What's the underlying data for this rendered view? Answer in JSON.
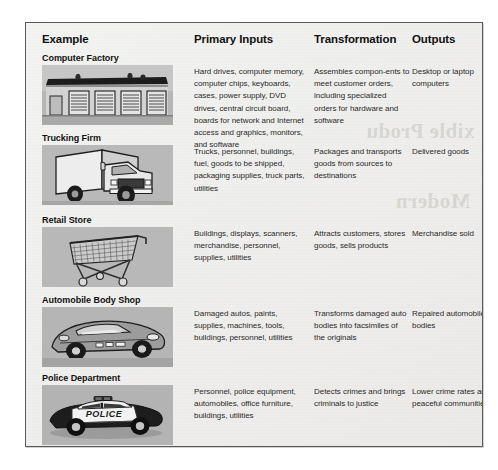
{
  "page": {
    "bleed_through_line1": "xible Produ",
    "bleed_through_line2": "Modern"
  },
  "table": {
    "columns": [
      {
        "key": "example",
        "label": "Example"
      },
      {
        "key": "inputs",
        "label": "Primary Inputs"
      },
      {
        "key": "transform",
        "label": "Transformation"
      },
      {
        "key": "outputs",
        "label": "Outputs"
      }
    ],
    "rows": [
      {
        "name": "Computer Factory",
        "image": "computer-factory-illustration",
        "inputs": "Hard drives, computer memory, computer chips, keyboards, cases, power supply, DVD drives, central circuit board, boards for network and Internet access and graphics, monitors, and software",
        "transform": "Assembles compon-ents to meet customer orders, including specialized orders for hardware and software",
        "outputs": "Desktop or laptop computers"
      },
      {
        "name": "Trucking Firm",
        "image": "delivery-truck-illustration",
        "inputs": "Trucks, personnel, buildings, fuel, goods to be shipped, packaging supplies, truck parts, utilities",
        "transform": "Packages and transports goods from sources to destinations",
        "outputs": "Delivered goods"
      },
      {
        "name": "Retail Store",
        "image": "shopping-cart-illustration",
        "inputs": "Buildings, displays, scanners, merchandise, personnel, supplies, utilities",
        "transform": "Attracts customers, stores goods, sells products",
        "outputs": "Merchandise sold"
      },
      {
        "name": "Automobile Body Shop",
        "image": "sports-car-illustration",
        "inputs": "Damaged autos, paints, supplies, machines, tools, buildings, personnel, utilities",
        "transform": "Transforms damaged auto bodies into facsimiles of the originals",
        "outputs": "Repaired automobile bodies"
      },
      {
        "name": "Police Department",
        "image": "police-car-illustration",
        "inputs": "Personnel, police equipment, automobiles, office furniture, buildings, utilities",
        "transform": "Detects crimes and brings criminals to justice",
        "outputs": "Lower crime rates and peaceful communities"
      }
    ]
  },
  "colors": {
    "page_background": "#f0efed",
    "border": "#5a5a5a",
    "thumb_background": "#b4b4b4",
    "text": "#2b2b2b",
    "heading": "#111111"
  }
}
